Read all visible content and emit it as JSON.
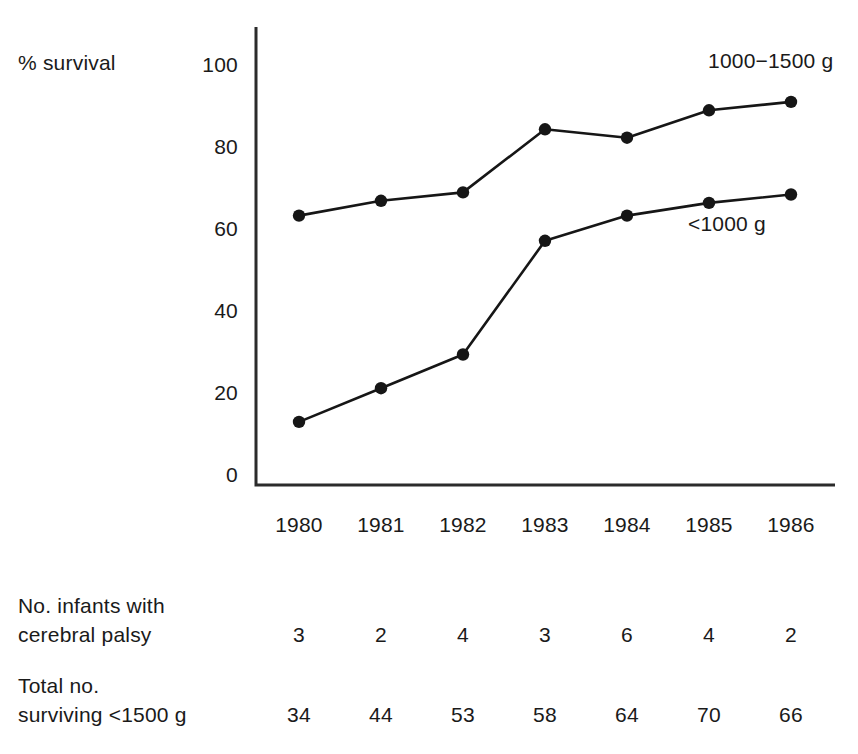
{
  "chart_data": {
    "type": "line",
    "title": "",
    "xlabel": "",
    "ylabel": "% survival",
    "categories": [
      "1980",
      "1981",
      "1982",
      "1983",
      "1984",
      "1985",
      "1986"
    ],
    "ylim": [
      0,
      100
    ],
    "yticks": [
      "0",
      "20",
      "40",
      "60",
      "80",
      "100"
    ],
    "grid": false,
    "legend_position": "inline-annotation",
    "series": [
      {
        "name": "1000−1500 g",
        "values": [
          64,
          67.5,
          69.5,
          84.5,
          82.5,
          89,
          91
        ]
      },
      {
        "name": "<1000 g",
        "values": [
          15,
          23,
          31,
          58,
          64,
          67,
          69
        ]
      }
    ],
    "annotations": [
      {
        "text": "1000−1500 g",
        "series": "1000−1500 g"
      },
      {
        "text": "<1000 g",
        "series": "<1000 g"
      }
    ],
    "tables": [
      {
        "label_line1": "No. infants with",
        "label_line2": "cerebral palsy",
        "values": [
          "3",
          "2",
          "4",
          "3",
          "6",
          "4",
          "2"
        ]
      },
      {
        "label_line1": "Total no.",
        "label_line2": "surviving <1500 g",
        "values": [
          "34",
          "44",
          "53",
          "58",
          "64",
          "70",
          "66"
        ]
      }
    ],
    "colors": {
      "line": "#161616",
      "marker": "#161616",
      "axis": "#2b2b2b",
      "text": "#1a1a1a",
      "background": "#ffffff"
    }
  }
}
